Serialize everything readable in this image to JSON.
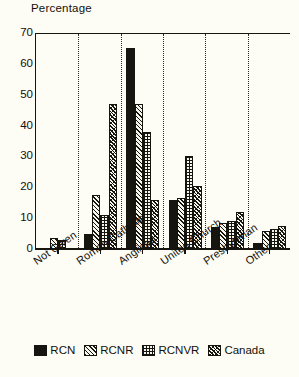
{
  "chart_data": {
    "type": "bar",
    "title": "",
    "ylabel": "Percentage",
    "xlabel": "",
    "ylim": [
      0,
      70
    ],
    "yticks": [
      0,
      10,
      20,
      30,
      40,
      50,
      60,
      70
    ],
    "grid": false,
    "group_separators": true,
    "legend_position": "bottom",
    "categories": [
      "Not Given",
      "Roman Catholic",
      "Anglican",
      "United Church",
      "Presbyterian",
      "Other"
    ],
    "series": [
      {
        "name": "RCN",
        "pattern": "solid-black",
        "values": [
          0,
          5,
          65,
          16,
          7,
          2
        ]
      },
      {
        "name": "RCNR",
        "pattern": "diagonal-hatch",
        "values": [
          3.5,
          17.5,
          47,
          16.5,
          8.5,
          6
        ]
      },
      {
        "name": "RCNVR",
        "pattern": "grid-hatch",
        "values": [
          3,
          11,
          38,
          30,
          9,
          6.5
        ]
      },
      {
        "name": "Canada",
        "pattern": "dense-diagonal",
        "values": [
          0,
          47,
          16,
          20.5,
          12,
          7.5
        ]
      }
    ]
  },
  "legend": {
    "items": [
      {
        "label": "RCN"
      },
      {
        "label": "RCNR"
      },
      {
        "label": "RCNVR"
      },
      {
        "label": "Canada"
      }
    ]
  },
  "colors": {
    "ink": "#17150f",
    "paper": "#fdfcf5"
  }
}
